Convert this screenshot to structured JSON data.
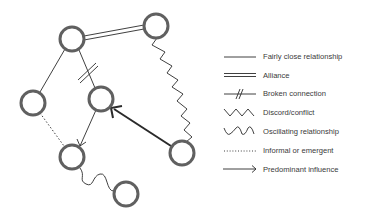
{
  "diagram": {
    "type": "relationship-map",
    "nodes": [
      {
        "id": "A",
        "x": 72,
        "y": 39
      },
      {
        "id": "B",
        "x": 156,
        "y": 26
      },
      {
        "id": "C",
        "x": 33,
        "y": 103
      },
      {
        "id": "D",
        "x": 101,
        "y": 99
      },
      {
        "id": "E",
        "x": 72,
        "y": 157
      },
      {
        "id": "F",
        "x": 182,
        "y": 153
      },
      {
        "id": "G",
        "x": 126,
        "y": 194
      }
    ],
    "edges": [
      {
        "from": "A",
        "to": "B",
        "type": "alliance"
      },
      {
        "from": "A",
        "to": "C",
        "type": "fairly-close"
      },
      {
        "from": "A",
        "to": "D",
        "type": "broken"
      },
      {
        "from": "B",
        "to": "F",
        "type": "discord"
      },
      {
        "from": "C",
        "to": "E",
        "type": "informal"
      },
      {
        "from": "D",
        "to": "E",
        "type": "influence"
      },
      {
        "from": "F",
        "to": "D",
        "type": "predominant-influence"
      },
      {
        "from": "E",
        "to": "G",
        "type": "oscillating"
      }
    ],
    "colors": {
      "node_stroke": "#606060",
      "line": "#2a2a2a",
      "text": "#3a3a3a"
    }
  },
  "legend": {
    "items": [
      {
        "symbol": "solid-line",
        "label": "Fairly close relationship"
      },
      {
        "symbol": "double-line",
        "label": "Alliance"
      },
      {
        "symbol": "broken-line",
        "label": "Broken connection"
      },
      {
        "symbol": "zigzag-line",
        "label": "Discord/conflict"
      },
      {
        "symbol": "wave-line",
        "label": "Oscillating relationship"
      },
      {
        "symbol": "dotted-line",
        "label": "Informal or emergent"
      },
      {
        "symbol": "arrow-line",
        "label": "Predominant influence"
      }
    ]
  }
}
